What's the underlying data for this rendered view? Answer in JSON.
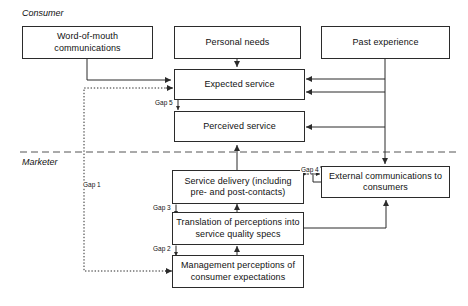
{
  "diagram": {
    "sections": [
      {
        "id": "consumer",
        "label": "Consumer"
      },
      {
        "id": "marketer",
        "label": "Marketer"
      }
    ],
    "nodes": [
      {
        "id": "word-of-mouth",
        "label": "Word-of-mouth communications"
      },
      {
        "id": "personal-needs",
        "label": "Personal needs"
      },
      {
        "id": "past-experience",
        "label": "Past experience"
      },
      {
        "id": "expected-service",
        "label": "Expected service"
      },
      {
        "id": "perceived-service",
        "label": "Perceived service"
      },
      {
        "id": "service-delivery",
        "label": "Service delivery (including pre- and post-contacts)"
      },
      {
        "id": "external-communications",
        "label": "External communications to consumers"
      },
      {
        "id": "translation-of-perceptions",
        "label": "Translation of perceptions into service quality specs"
      },
      {
        "id": "management-perceptions",
        "label": "Management perceptions of consumer expectations"
      }
    ],
    "gaps": [
      {
        "id": "gap-1",
        "label": "Gap 1"
      },
      {
        "id": "gap-2",
        "label": "Gap 2"
      },
      {
        "id": "gap-3",
        "label": "Gap 3"
      },
      {
        "id": "gap-4",
        "label": "Gap 4"
      },
      {
        "id": "gap-5",
        "label": "Gap 5"
      }
    ],
    "colors": {
      "line": "#2b2b2b",
      "text": "#111111",
      "background": "#ffffff",
      "divider": "#555555"
    }
  }
}
